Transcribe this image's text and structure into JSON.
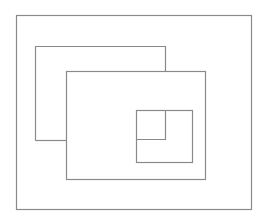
{
  "diagram": {
    "width": 265,
    "height": 220,
    "background": "#ffffff",
    "stroke_color": "#8a8a8a",
    "stroke_width": 1.2,
    "shapes": [
      {
        "id": "outer-frame",
        "type": "rect",
        "x": 16,
        "y": 15,
        "w": 235,
        "h": 194
      },
      {
        "id": "back-rect-top-left",
        "type": "polyline",
        "points": [
          [
            35,
            140
          ],
          [
            35,
            46
          ],
          [
            165,
            46
          ],
          [
            165,
            71
          ]
        ]
      },
      {
        "id": "back-rect-bottom-stub",
        "type": "line",
        "points": [
          [
            35,
            140
          ],
          [
            66,
            140
          ]
        ]
      },
      {
        "id": "front-rect",
        "type": "rect",
        "x": 66,
        "y": 71,
        "w": 139,
        "h": 108
      },
      {
        "id": "inner-rect",
        "type": "rect",
        "x": 136,
        "y": 110,
        "w": 56,
        "h": 52
      },
      {
        "id": "back-rect-corner-in-inner",
        "type": "polyline",
        "points": [
          [
            165,
            110
          ],
          [
            165,
            139
          ],
          [
            136,
            139
          ]
        ]
      }
    ]
  }
}
